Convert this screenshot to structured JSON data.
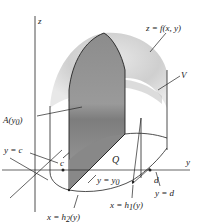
{
  "diagram": {
    "type": "volume-by-cross-sections",
    "axes": {
      "z": "z",
      "y": "y"
    },
    "labels": {
      "surface": "z = f(x, y)",
      "volume": "V",
      "cross_section": "A(y",
      "cross_section_sub": "0",
      "cross_section_close": ")",
      "y_equals_c": "y = c",
      "c": "c",
      "region": "Q",
      "y_equals_y0": "y = y",
      "y_equals_y0_sub": "0",
      "d": "d",
      "y_equals_d": "y = d",
      "x_h1_prefix": "x = h",
      "x_h1_sub": "1",
      "x_h1_suffix": "(y)",
      "x_h2_prefix": "x = h",
      "x_h2_sub": "2",
      "x_h2_suffix": "(y)"
    },
    "colors": {
      "surface_light": "#d4d4d4",
      "surface_mid": "#b0b0b0",
      "cross_section": "#8a8a8a",
      "cross_section_base": "#9a9a9a",
      "line": "#222222"
    }
  }
}
